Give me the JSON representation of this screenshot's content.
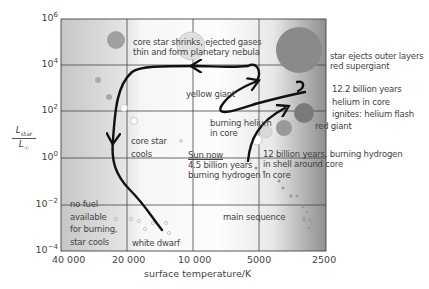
{
  "diagram": {
    "type": "Hertzsprung-Russell diagram",
    "title": "",
    "axes": {
      "x": {
        "label": "surface temperature/K",
        "ticks": [
          "40 000",
          "20 000",
          "10 000",
          "5000",
          "2500"
        ]
      },
      "y": {
        "label_num": "L",
        "label_num_sub": "star",
        "label_den": "L",
        "label_den_sub": "☉",
        "ticks": [
          {
            "base": "10",
            "exp": "6"
          },
          {
            "base": "10",
            "exp": "4"
          },
          {
            "base": "10",
            "exp": "2"
          },
          {
            "base": "10",
            "exp": "0"
          },
          {
            "base": "10",
            "exp": "−2"
          },
          {
            "base": "10",
            "exp": "−4"
          }
        ]
      }
    },
    "annotations": {
      "planetary_nebula_1": "core star shrinks, ejected gases",
      "planetary_nebula_2": "thin and form planetary nebula",
      "supergiant_1": "star ejects outer layers",
      "supergiant_2": "red supergiant",
      "helium_flash_1": "12.2 billion years",
      "helium_flash_2": "helium in core",
      "helium_flash_3": "ignites: helium flash",
      "yellow_giant": "yellow giant",
      "burning_helium_1": "burning helium",
      "burning_helium_2": "in core",
      "red_giant": "red giant",
      "core_star_1": "core star",
      "core_star_2": "cools",
      "sun_now_1": "Sun now",
      "sun_now_2": "4.5 billion years",
      "sun_now_3": "burning hydrogen in core",
      "shell_1": "12 billion years, burning hydrogen",
      "shell_2": "in shell around core",
      "no_fuel_1": "no fuel",
      "no_fuel_2": "available",
      "no_fuel_3": "for burning,",
      "no_fuel_4": "star cools",
      "white_dwarf": "white dwarf",
      "main_sequence": "main sequence"
    },
    "colors": {
      "grid": "#333333",
      "path": "#111111",
      "left_band": "#c8c8c8",
      "right_band": "#8a8a8a",
      "supergiant": "#8c8c8c",
      "red_giant": "#7a7a7a"
    }
  }
}
